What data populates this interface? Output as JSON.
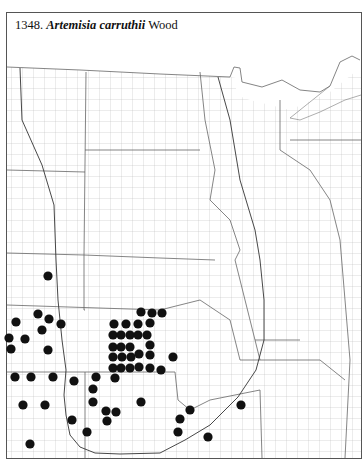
{
  "title": {
    "number": "1348.",
    "species": "Artemisia carruthii",
    "author": "Wood"
  },
  "colors": {
    "dot": "#111111",
    "border": "#555555",
    "county_line": "#9a9a9a",
    "state_line": "#666666",
    "range_line": "#333333"
  },
  "legend": {
    "marker": "filled-circle",
    "meaning": "county occurrence record"
  },
  "chart_data": {
    "type": "scatter",
    "title": "1348. Artemisia carruthii Wood",
    "xlabel": "",
    "ylabel": "",
    "grid": false,
    "points": [
      [
        48,
        276
      ],
      [
        38,
        314
      ],
      [
        16,
        322
      ],
      [
        49,
        319
      ],
      [
        61,
        324
      ],
      [
        42,
        330
      ],
      [
        9,
        338
      ],
      [
        25,
        339
      ],
      [
        11,
        349
      ],
      [
        48,
        350
      ],
      [
        15,
        377
      ],
      [
        31,
        377
      ],
      [
        53,
        377
      ],
      [
        74,
        381
      ],
      [
        96,
        377
      ],
      [
        115,
        378
      ],
      [
        93,
        389
      ],
      [
        93,
        402
      ],
      [
        23,
        405
      ],
      [
        45,
        405
      ],
      [
        106,
        411
      ],
      [
        116,
        412
      ],
      [
        107,
        421
      ],
      [
        72,
        420
      ],
      [
        87,
        432
      ],
      [
        30,
        444
      ],
      [
        141,
        312
      ],
      [
        152,
        313
      ],
      [
        162,
        313
      ],
      [
        114,
        324
      ],
      [
        126,
        324
      ],
      [
        138,
        324
      ],
      [
        150,
        323
      ],
      [
        113,
        335
      ],
      [
        121,
        335
      ],
      [
        130,
        335
      ],
      [
        138,
        335
      ],
      [
        147,
        335
      ],
      [
        113,
        347
      ],
      [
        121,
        347
      ],
      [
        130,
        347
      ],
      [
        150,
        345
      ],
      [
        113,
        357
      ],
      [
        122,
        357
      ],
      [
        131,
        357
      ],
      [
        139,
        354
      ],
      [
        150,
        355
      ],
      [
        173,
        357
      ],
      [
        113,
        368
      ],
      [
        121,
        368
      ],
      [
        130,
        368
      ],
      [
        139,
        367
      ],
      [
        150,
        368
      ],
      [
        161,
        370
      ],
      [
        141,
        402
      ],
      [
        190,
        410
      ],
      [
        180,
        419
      ],
      [
        178,
        432
      ],
      [
        208,
        437
      ],
      [
        241,
        405
      ]
    ]
  }
}
